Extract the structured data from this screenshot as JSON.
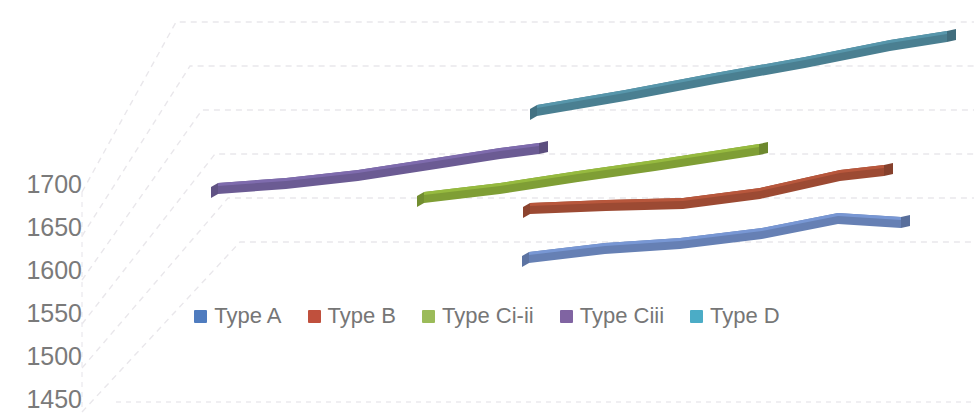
{
  "chart_data": {
    "type": "line",
    "render": "3d-ribbon-line",
    "title": "",
    "xlabel": "",
    "ylabel": "",
    "ylim": [
      1450,
      1700
    ],
    "yticks": [
      1700,
      1650,
      1600,
      1550,
      1500,
      1450
    ],
    "ytick_labels": [
      "1700",
      "1650",
      "1600",
      "1550",
      "1500",
      "1450"
    ],
    "grid": true,
    "grid_style": "dashed-faint",
    "legend_position": "bottom-center",
    "series": [
      {
        "name": "Type A",
        "color": "#6680b4",
        "depth_plane": 1,
        "x_start_px": 529,
        "x_end_px": 901,
        "values": [
          1628,
          1635,
          1640,
          1648,
          1672,
          1668
        ],
        "points": [
          {
            "x_px": 529,
            "y_px": 252
          },
          {
            "x_px": 605,
            "y_px": 243
          },
          {
            "x_px": 680,
            "y_px": 238
          },
          {
            "x_px": 762,
            "y_px": 228
          },
          {
            "x_px": 838,
            "y_px": 213
          },
          {
            "x_px": 901,
            "y_px": 217
          }
        ]
      },
      {
        "name": "Type B",
        "color": "#9c4a33",
        "depth_plane": 2,
        "x_start_px": 530,
        "x_end_px": 884,
        "values": [
          1690,
          1694,
          1697,
          1706,
          1717,
          1714
        ],
        "points": [
          {
            "x_px": 530,
            "y_px": 203
          },
          {
            "x_px": 606,
            "y_px": 200
          },
          {
            "x_px": 683,
            "y_px": 198
          },
          {
            "x_px": 760,
            "y_px": 188
          },
          {
            "x_px": 840,
            "y_px": 170
          },
          {
            "x_px": 884,
            "y_px": 165
          }
        ]
      },
      {
        "name": "Type Ci-ii",
        "color": "#7f9e35",
        "depth_plane": 3,
        "x_start_px": 424,
        "x_end_px": 759,
        "values": [
          1697,
          1705,
          1714,
          1724,
          1732,
          1736
        ],
        "points": [
          {
            "x_px": 424,
            "y_px": 192
          },
          {
            "x_px": 500,
            "y_px": 183
          },
          {
            "x_px": 578,
            "y_px": 171
          },
          {
            "x_px": 655,
            "y_px": 160
          },
          {
            "x_px": 720,
            "y_px": 150
          },
          {
            "x_px": 759,
            "y_px": 144
          }
        ]
      },
      {
        "name": "Type Ciii",
        "color": "#6b5b93",
        "depth_plane": 4,
        "x_start_px": 218,
        "x_end_px": 539,
        "values": [
          1712,
          1716,
          1726,
          1738,
          1748,
          1752
        ],
        "points": [
          {
            "x_px": 218,
            "y_px": 183
          },
          {
            "x_px": 286,
            "y_px": 178
          },
          {
            "x_px": 358,
            "y_px": 170
          },
          {
            "x_px": 436,
            "y_px": 158
          },
          {
            "x_px": 500,
            "y_px": 148
          },
          {
            "x_px": 539,
            "y_px": 143
          }
        ]
      },
      {
        "name": "Type D",
        "color": "#4a7f91",
        "depth_plane": 5,
        "x_start_px": 537,
        "x_end_px": 947,
        "values": [
          1760,
          1770,
          1781,
          1791,
          1801,
          1808
        ],
        "points": [
          {
            "x_px": 537,
            "y_px": 105
          },
          {
            "x_px": 625,
            "y_px": 90
          },
          {
            "x_px": 715,
            "y_px": 73
          },
          {
            "x_px": 805,
            "y_px": 57
          },
          {
            "x_px": 890,
            "y_px": 40
          },
          {
            "x_px": 947,
            "y_px": 31
          }
        ]
      }
    ]
  },
  "axis": {
    "y_ticks": [
      {
        "label": "1700",
        "y_px": 185
      },
      {
        "label": "1650",
        "y_px": 228
      },
      {
        "label": "1600",
        "y_px": 271
      },
      {
        "label": "1550",
        "y_px": 314
      },
      {
        "label": "1500",
        "y_px": 357
      },
      {
        "label": "1450",
        "y_px": 400
      }
    ]
  },
  "legend": {
    "items": [
      {
        "label": "Type A",
        "color": "#4f7cbf"
      },
      {
        "label": "Type B",
        "color": "#c0503d"
      },
      {
        "label": "Type Ci-ii",
        "color": "#9bbb59"
      },
      {
        "label": "Type Ciii",
        "color": "#8064a2"
      },
      {
        "label": "Type D",
        "color": "#4bacc6"
      }
    ]
  },
  "colors": {
    "grid": "#e8e6ea",
    "tick_text": "#7a7a7a",
    "legend_text": "#767676",
    "background": "#ffffff"
  }
}
